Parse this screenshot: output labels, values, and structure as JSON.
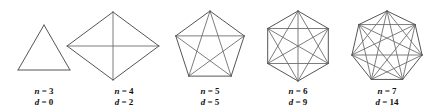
{
  "figure": {
    "background_color": "#ffffff",
    "edge_color": "#555555",
    "diagonal_color": "#6e6e6e",
    "label_color": "#111111",
    "shapes": [
      {
        "name": "triangle",
        "sides_label": "n = 3",
        "diagonals_label": "d = 0",
        "n_symbol": "n",
        "d_symbol": "d",
        "n_value": "3",
        "d_value": "0",
        "center_x": 44,
        "center_y": 55,
        "radius": 30,
        "rotation_deg": -90,
        "label_x": 44,
        "label_line1_y": 94,
        "label_line2_y": 105
      },
      {
        "name": "quadrilateral",
        "sides_label": "n = 4",
        "diagonals_label": "d = 2",
        "n_symbol": "n",
        "d_symbol": "d",
        "n_value": "4",
        "d_value": "2",
        "center_x": 113,
        "center_y": 46,
        "radius": 34,
        "rotation_deg": -90,
        "stretch_x": 1.35,
        "label_x": 124,
        "label_line1_y": 94,
        "label_line2_y": 105
      },
      {
        "name": "pentagon",
        "sides_label": "n = 5",
        "diagonals_label": "d = 5",
        "n_symbol": "n",
        "d_symbol": "d",
        "n_value": "5",
        "d_value": "5",
        "center_x": 210,
        "center_y": 47,
        "radius": 36,
        "rotation_deg": -90,
        "label_x": 210,
        "label_line1_y": 94,
        "label_line2_y": 105
      },
      {
        "name": "hexagon",
        "sides_label": "n = 6",
        "diagonals_label": "d = 9",
        "n_symbol": "n",
        "d_symbol": "d",
        "n_value": "6",
        "d_value": "9",
        "center_x": 298,
        "center_y": 46,
        "radius": 35,
        "rotation_deg": -90,
        "label_x": 298,
        "label_line1_y": 94,
        "label_line2_y": 105
      },
      {
        "name": "heptagon",
        "sides_label": "n = 7",
        "diagonals_label": "d = 14",
        "n_symbol": "n",
        "d_symbol": "d",
        "n_value": "7",
        "d_value": "14",
        "center_x": 387,
        "center_y": 47,
        "radius": 36,
        "rotation_deg": -90,
        "label_x": 387,
        "label_line1_y": 94,
        "label_line2_y": 105
      }
    ]
  }
}
